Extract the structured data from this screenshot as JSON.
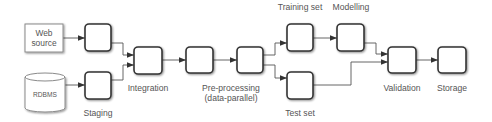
{
  "diagram": {
    "type": "data-pipeline-flowchart",
    "colors": {
      "background": "#ffffff",
      "node_stroke": "#333333",
      "source_stroke": "#8a8a8a",
      "edge": "#555555",
      "text": "#555555"
    },
    "sources": {
      "web": {
        "line1": "Web",
        "line2": "source"
      },
      "db": {
        "label": "RDBMS"
      }
    },
    "labels": {
      "staging": "Staging",
      "integration": "Integration",
      "preprocessing_line1": "Pre-processing",
      "preprocessing_line2": "(data-parallel)",
      "training_set": "Training set",
      "test_set": "Test set",
      "modelling": "Modelling",
      "validation": "Validation",
      "storage": "Storage"
    },
    "nodes": [
      {
        "id": "web-source",
        "label": "Web source",
        "kind": "source"
      },
      {
        "id": "rdbms",
        "label": "RDBMS",
        "kind": "database"
      },
      {
        "id": "staging-web",
        "label": "",
        "kind": "process",
        "group": "Staging"
      },
      {
        "id": "staging-db",
        "label": "",
        "kind": "process",
        "group": "Staging"
      },
      {
        "id": "integration",
        "label": "",
        "kind": "process",
        "group": "Integration"
      },
      {
        "id": "preprocessing-1",
        "label": "",
        "kind": "process",
        "group": "Pre-processing (data-parallel)"
      },
      {
        "id": "preprocessing-2",
        "label": "",
        "kind": "process",
        "group": "Pre-processing (data-parallel)"
      },
      {
        "id": "training-set",
        "label": "",
        "kind": "process",
        "group": "Training set"
      },
      {
        "id": "test-set",
        "label": "",
        "kind": "process",
        "group": "Test set"
      },
      {
        "id": "modelling",
        "label": "",
        "kind": "process",
        "group": "Modelling"
      },
      {
        "id": "validation",
        "label": "",
        "kind": "process",
        "group": "Validation"
      },
      {
        "id": "storage",
        "label": "",
        "kind": "process",
        "group": "Storage"
      }
    ],
    "edges": [
      [
        "web-source",
        "staging-web"
      ],
      [
        "rdbms",
        "staging-db"
      ],
      [
        "staging-web",
        "integration"
      ],
      [
        "staging-db",
        "integration"
      ],
      [
        "integration",
        "preprocessing-1"
      ],
      [
        "preprocessing-1",
        "preprocessing-2"
      ],
      [
        "preprocessing-2",
        "training-set"
      ],
      [
        "preprocessing-2",
        "test-set"
      ],
      [
        "training-set",
        "modelling"
      ],
      [
        "modelling",
        "validation"
      ],
      [
        "test-set",
        "validation"
      ],
      [
        "validation",
        "storage"
      ]
    ]
  }
}
